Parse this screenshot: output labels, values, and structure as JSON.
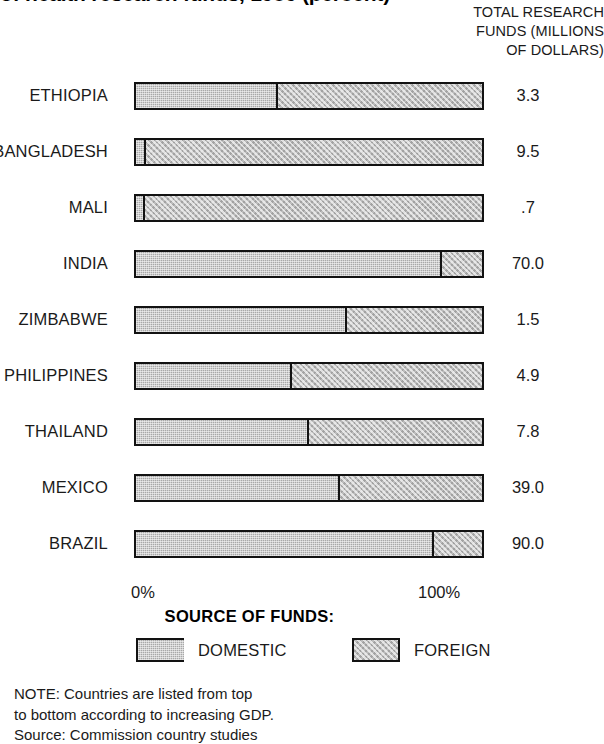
{
  "chart_data": {
    "type": "bar",
    "subtype": "horizontal-stacked-100-percent",
    "title": "of health research funds, 1986 (percent)",
    "xlabel": "",
    "ylabel": "",
    "xlim": [
      0,
      100
    ],
    "grid": false,
    "legend_position": "bottom",
    "legend_title": "SOURCE OF FUNDS:",
    "axis_ticks": [
      "0%",
      "100%"
    ],
    "categories": [
      "ETHIOPIA",
      "BANGLADESH",
      "MALI",
      "INDIA",
      "ZIMBABWE",
      "PHILIPPINES",
      "THAILAND",
      "MEXICO",
      "BRAZIL"
    ],
    "series": [
      {
        "name": "DOMESTIC",
        "color": "#a8a8a8",
        "values": [
          41,
          3,
          2.5,
          88.5,
          61,
          45,
          50,
          59,
          86
        ]
      },
      {
        "name": "FOREIGN",
        "color": "#bdbdbd",
        "values": [
          59,
          97,
          97.5,
          11.5,
          39,
          55,
          50,
          41,
          14
        ]
      }
    ],
    "annotations": {
      "value_column_header": "TOTAL RESEARCH FUNDS (MILLIONS OF DOLLARS)",
      "value_column_values": [
        "3.3",
        "9.5",
        ".7",
        "70.0",
        "1.5",
        "4.9",
        "7.8",
        "39.0",
        "90.0"
      ]
    }
  },
  "header": {
    "title": "of health research funds, 1986 (percent)",
    "value_column_lines": [
      "TOTAL RESEARCH",
      "FUNDS (MILLIONS",
      "OF DOLLARS)"
    ]
  },
  "rows": [
    {
      "label": "ETHIOPIA",
      "domestic": 41,
      "value": "3.3"
    },
    {
      "label": "BANGLADESH",
      "domestic": 3,
      "value": "9.5"
    },
    {
      "label": "MALI",
      "domestic": 2.5,
      "value": ".7"
    },
    {
      "label": "INDIA",
      "domestic": 88.5,
      "value": "70.0"
    },
    {
      "label": "ZIMBABWE",
      "domestic": 61,
      "value": "1.5"
    },
    {
      "label": "PHILIPPINES",
      "domestic": 45,
      "value": "4.9"
    },
    {
      "label": "THAILAND",
      "domestic": 50,
      "value": "7.8"
    },
    {
      "label": "MEXICO",
      "domestic": 59,
      "value": "39.0"
    },
    {
      "label": "BRAZIL",
      "domestic": 86,
      "value": "90.0"
    }
  ],
  "axis": {
    "tick_min": "0%",
    "tick_max": "100%"
  },
  "legend": {
    "title": "SOURCE OF FUNDS:",
    "entries": [
      {
        "label": "DOMESTIC",
        "color": "#a8a8a8"
      },
      {
        "label": "FOREIGN",
        "color": "#bdbdbd"
      }
    ]
  },
  "footnote": {
    "lines": [
      "NOTE: Countries are listed from top",
      "to bottom according to increasing GDP.",
      "Source: Commission country studies"
    ]
  }
}
